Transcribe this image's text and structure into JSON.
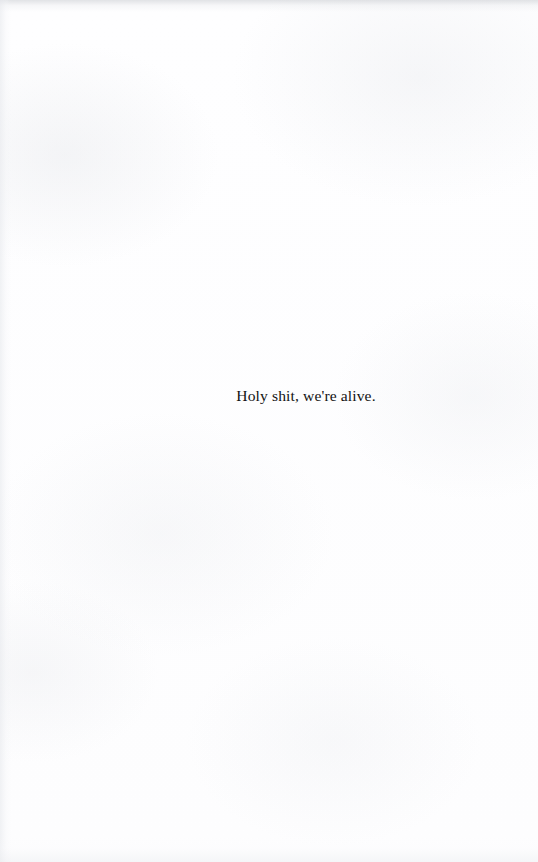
{
  "page": {
    "kind": "scanned-book-page",
    "width": 538,
    "height": 862,
    "paper_color": "#fefefe",
    "ink_color": "#131313"
  },
  "content": {
    "body_text": "Holy shit, we're alive."
  },
  "artifacts": {
    "top_edge_smudge": "#c4c7cc",
    "left_edge_tone": "#e8eaee",
    "bottom_edge_tone": "#ebedf0"
  }
}
